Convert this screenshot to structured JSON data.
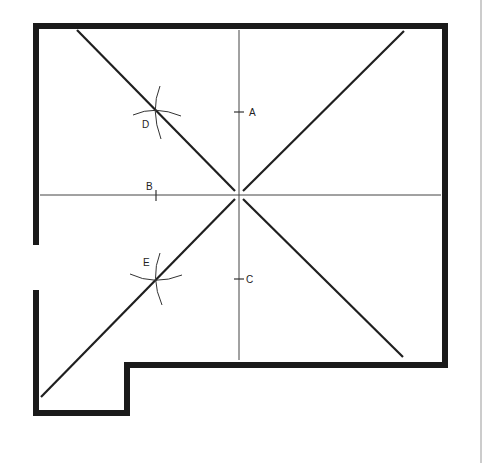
{
  "diagram": {
    "type": "floor-plan-geometric-construction",
    "labels": {
      "A": "A",
      "B": "B",
      "C": "C",
      "D": "D",
      "E": "E"
    },
    "colors": {
      "wall": "#1a1a1a",
      "line": "#2a2a2a",
      "construction": "#555555",
      "background": "#ffffff",
      "margin_rule": "#888888"
    }
  }
}
